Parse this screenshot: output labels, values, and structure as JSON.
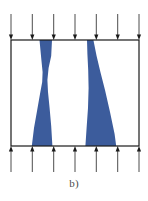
{
  "figure": {
    "caption": "b)",
    "title": "",
    "colors": {
      "specimen_blue": "#3c5c9c",
      "frame_line": "#1a1a1a",
      "arrow_line": "#4d4d4d",
      "arrow_head": "#1a1a1a",
      "background": "#ffffff",
      "caption_text": "#4b4b4b"
    },
    "frame": {
      "name": "specimen-boundary-rectangle",
      "x": 11,
      "y": 40,
      "width": 128,
      "height": 106,
      "stroke_width": 1.2
    },
    "loading": {
      "top_label": "compressive load arrows pointing down",
      "bottom_label": "reaction load arrows pointing up",
      "arrow_count": 7,
      "arrow_x_positions": [
        11,
        32.3,
        53.7,
        75,
        96.3,
        117.7,
        139
      ],
      "top_arrow_tail_y": 14,
      "top_arrow_tip_y": 40,
      "bottom_arrow_tail_y": 172,
      "bottom_arrow_tip_y": 146,
      "head_width": 4.2,
      "head_length": 5.5,
      "shaft_width": 1.0
    },
    "shear_bands": [
      {
        "name": "left-shear-band",
        "description": "hourglass shaped deformation band, wide at top and bottom, necked at mid-height",
        "path": "M 39.5 40 L 52.0 40 L 51.2 56 L 48.6 68 L 47.4 80 L 48.0 92 L 49.6 108 L 51.2 126 L 52.4 146 L 31.8 146 L 34.0 128 L 37.2 110 L 40.0 94 L 42.2 82 L 42.6 72 L 41.4 60 L 39.5 40 Z"
      },
      {
        "name": "right-shear-band",
        "description": "inclined deformation band narrow at top, broadening toward lower right",
        "path": "M 87.0 40 L 93.4 40 L 96.6 56 L 100.4 72 L 105.0 90 L 110.0 112 L 114.6 134 L 116.2 146 L 85.4 146 L 86.6 128 L 88.0 108 L 88.6 88 L 88.2 70 L 87.4 54 L 87.0 40 Z"
      }
    ]
  }
}
